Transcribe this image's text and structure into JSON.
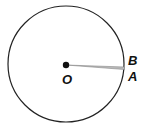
{
  "diagram": {
    "center_label": "O",
    "point_labels": [
      "B",
      "A"
    ],
    "colors": {
      "stroke": "#222222",
      "sector": "#999999"
    }
  }
}
